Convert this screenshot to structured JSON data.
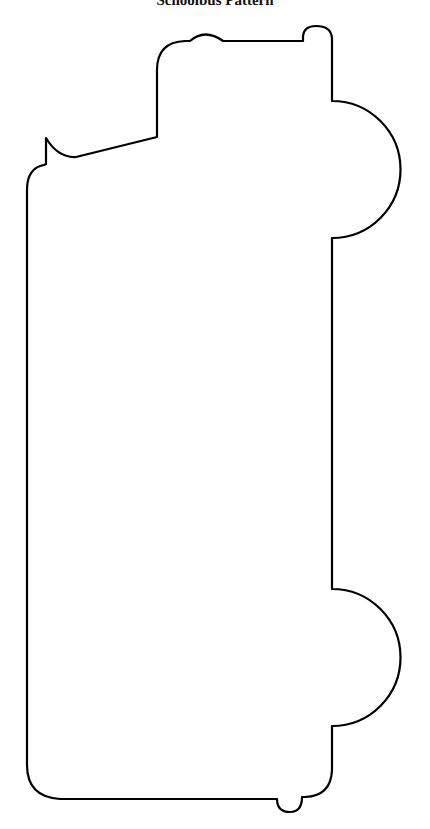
{
  "page": {
    "title": "Schoolbus Pattern"
  },
  "pattern": {
    "stroke_color": "#000000",
    "stroke_width": 2.2,
    "shape": "school-bus-outline",
    "features": [
      "cab-top",
      "roof-light-bump",
      "front-hood-hook",
      "top-wheel-arch",
      "bottom-wheel-arch",
      "rear-bumper-bump"
    ]
  }
}
